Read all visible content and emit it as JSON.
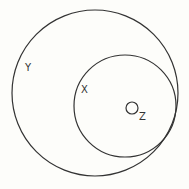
{
  "diagram": {
    "type": "nested-circles",
    "circles": [
      {
        "name": "Y",
        "cx": 95,
        "cy": 93,
        "r": 83
      },
      {
        "name": "X",
        "cx": 125,
        "cy": 106,
        "r": 51
      },
      {
        "name": "Z",
        "cx": 132,
        "cy": 108,
        "r": 6
      }
    ],
    "labels": {
      "y": "Y",
      "x": "X",
      "z": "Z"
    },
    "stroke_color": "#333333",
    "background": "#fdfdfa"
  }
}
